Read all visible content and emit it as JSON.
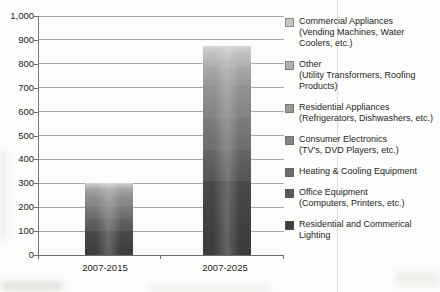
{
  "chart_data": {
    "type": "bar",
    "stacked": true,
    "title": "",
    "xlabel": "",
    "ylabel": "",
    "categories": [
      "2007-2015",
      "2007-2025"
    ],
    "series": [
      {
        "name": "Commercial Appliances",
        "detail": "(Vending Machines, Water Coolers, etc.)",
        "color": "#c5c5c5",
        "color_top": "#d6d6d6",
        "values": [
          8,
          25
        ]
      },
      {
        "name": "Other",
        "detail": "(Utility Transformers, Roofing Products)",
        "color": "#b1b1b1",
        "color_top": "#c2c2c2",
        "values": [
          12,
          60
        ]
      },
      {
        "name": "Residential Appliances",
        "detail": "(Refrigerators, Dishwashers, etc.)",
        "color": "#9a9a9a",
        "color_top": "#ababab",
        "values": [
          25,
          80
        ]
      },
      {
        "name": "Consumer Electronics",
        "detail": "(TV's, DVD Players, etc.)",
        "color": "#858585",
        "color_top": "#949494",
        "values": [
          50,
          135
        ]
      },
      {
        "name": "Heating & Cooling Equipment",
        "detail": "",
        "color": "#6f6f6f",
        "color_top": "#7d7d7d",
        "values": [
          50,
          135
        ]
      },
      {
        "name": "Office Equipment",
        "detail": "(Computers, Printers, etc.)",
        "color": "#585858",
        "color_top": "#666666",
        "values": [
          55,
          130
        ]
      },
      {
        "name": "Residential and Commerical Lighting",
        "detail": "",
        "color": "#3d3d3d",
        "color_top": "#4a4a4a",
        "values": [
          100,
          310
        ]
      }
    ],
    "ylim": [
      0,
      1000
    ],
    "ytick_step": 100,
    "ytick_labels": [
      "0",
      "100",
      "200",
      "300",
      "400",
      "500",
      "600",
      "700",
      "800",
      "900",
      "1,000"
    ],
    "grid": "horizontal",
    "legend_position": "right"
  }
}
